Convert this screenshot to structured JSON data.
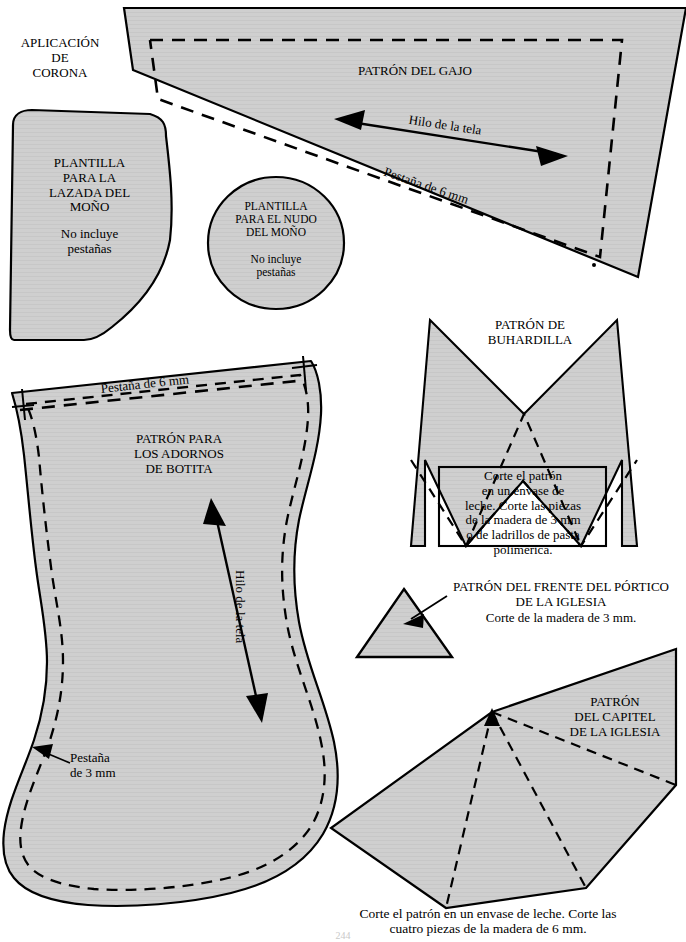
{
  "document": {
    "type": "craft-pattern-sheet",
    "language": "es",
    "page_number": "244",
    "fill_color": "#cfcfcf",
    "line_color": "#000000",
    "background": "#ffffff"
  },
  "labels": {
    "aplicacion_corona": "APLICACIÓN\nDE\nCORONA",
    "patron_gajo": "PATRÓN DEL GAJO",
    "hilo_tela_gajo": "Hilo de la tela",
    "pestana_6mm_gajo": "Pestaña de 6 mm",
    "plantilla_lazada": "PLANTILLA\nPARA LA\nLAZADA DEL\nMOÑO",
    "plantilla_lazada_nota": "No incluye\npestañas",
    "plantilla_nudo": "PLANTILLA\nPARA EL NUDO\nDEL MOÑO",
    "plantilla_nudo_nota": "No incluye\npestañas",
    "patron_botita": "PATRÓN PARA\nLOS ADORNOS\nDE BOTITA",
    "pestana_6mm_botita": "Pestaña de 6 mm",
    "hilo_tela_botita": "Hilo de la tela",
    "pestana_3mm_botita": "Pestaña\nde 3 mm",
    "patron_buhardilla": "PATRÓN DE\nBUHARDILLA",
    "buhardilla_nota": "Corte el patrón\nen un envase de\nleche. Corte las piezas\nde la madera de 3 mm\no de ladrillos de pasta\npolimérica.",
    "patron_portico": "PATRÓN DEL FRENTE DEL PÓRTICO\nDE LA IGLESIA",
    "portico_nota": "Corte de la madera de 3 mm.",
    "patron_capitel": "PATRÓN\nDEL CAPITEL\nDE LA IGLESIA",
    "capitel_nota": "Corte el patrón en un envase de leche. Corte las\ncuatro piezas de la madera de 6 mm."
  },
  "pieces": [
    {
      "id": "gajo",
      "name": "Patrón del gajo",
      "seam_allowance": "6 mm",
      "grainline": true
    },
    {
      "id": "lazada-mono",
      "name": "Plantilla para la lazada del moño",
      "seam_allowance": "none",
      "grainline": false
    },
    {
      "id": "nudo-mono",
      "name": "Plantilla para el nudo del moño",
      "seam_allowance": "none",
      "grainline": false
    },
    {
      "id": "botita",
      "name": "Patrón para los adornos de botita",
      "seam_allowance": "6 mm / 3 mm",
      "grainline": true
    },
    {
      "id": "buhardilla",
      "name": "Patrón de buhardilla",
      "material": "envase de leche / madera de 3 mm",
      "grainline": false
    },
    {
      "id": "portico-iglesia",
      "name": "Patrón del frente del pórtico de la iglesia",
      "material": "madera de 3 mm",
      "grainline": false
    },
    {
      "id": "capitel-iglesia",
      "name": "Patrón del capitel de la iglesia",
      "material": "envase de leche / madera de 6 mm",
      "grainline": false
    }
  ]
}
